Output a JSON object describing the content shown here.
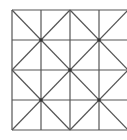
{
  "diagram": {
    "type": "grid-with-diagonals",
    "grid": {
      "rows": 4,
      "cols": 4,
      "x0": 12,
      "y0": 10,
      "cell": 29.5
    },
    "line_color": "#555555",
    "dot_color": "#333333",
    "vertices_with_dots": [
      [
        1,
        1
      ],
      [
        3,
        1
      ],
      [
        2,
        2
      ],
      [
        1,
        3
      ],
      [
        3,
        3
      ]
    ]
  }
}
